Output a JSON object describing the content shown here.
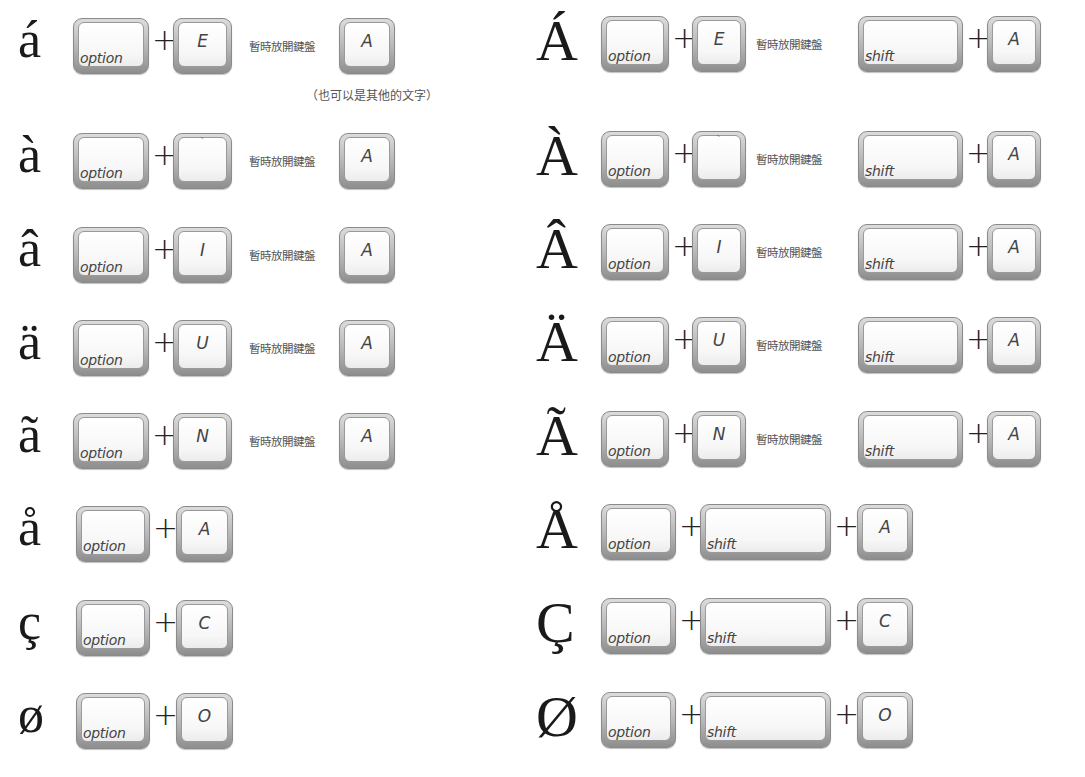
{
  "release_label": "暫時放開鍵盤",
  "note": "（也可以是其他的文字）",
  "keys": {
    "option": "option",
    "shift": "shift",
    "plus": "+"
  },
  "left_rows": [
    {
      "char": "á",
      "dead_key": "E",
      "then": "A"
    },
    {
      "char": "à",
      "dead_key": "`",
      "then": "A"
    },
    {
      "char": "â",
      "dead_key": "I",
      "then": "A"
    },
    {
      "char": "ä",
      "dead_key": "U",
      "then": "A"
    },
    {
      "char": "ã",
      "dead_key": "N",
      "then": "A"
    },
    {
      "char": "å",
      "key": "A"
    },
    {
      "char": "ç",
      "key": "C"
    },
    {
      "char": "ø",
      "key": "O"
    }
  ],
  "right_rows": [
    {
      "char": "Á",
      "dead_key": "E",
      "then": "A"
    },
    {
      "char": "À",
      "dead_key": "`",
      "then": "A"
    },
    {
      "char": "Â",
      "dead_key": "I",
      "then": "A"
    },
    {
      "char": "Ä",
      "dead_key": "U",
      "then": "A"
    },
    {
      "char": "Ã",
      "dead_key": "N",
      "then": "A"
    },
    {
      "char": "Å",
      "key": "A"
    },
    {
      "char": "Ç",
      "key": "C"
    },
    {
      "char": "Ø",
      "key": "O"
    }
  ]
}
